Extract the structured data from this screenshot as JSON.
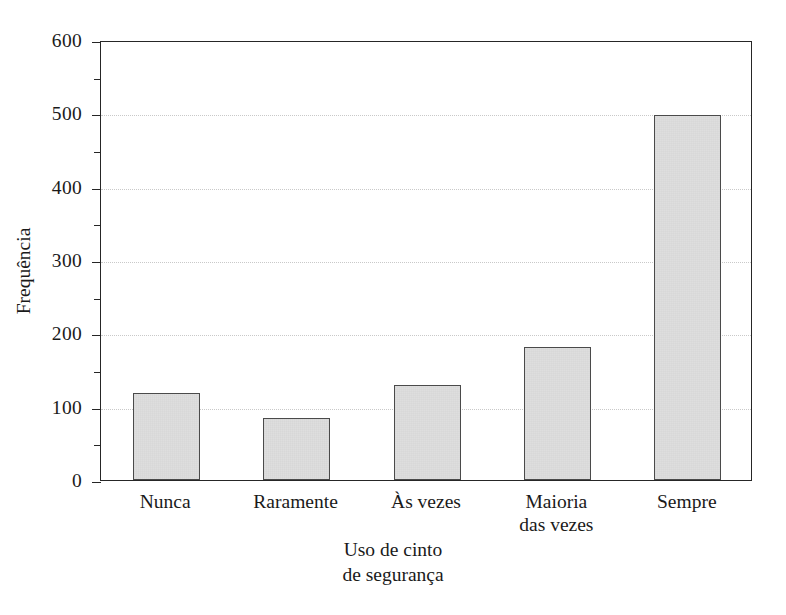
{
  "chart_data": {
    "type": "bar",
    "title": "",
    "categories": [
      "Nunca",
      "Raramente",
      "Às vezes",
      "Maioria\ndas vezes",
      "Sempre"
    ],
    "values": [
      118,
      85,
      130,
      182,
      498
    ],
    "xlabel": "Uso de cinto\nde segurança",
    "ylabel": "Frequência",
    "ylim": [
      0,
      600
    ],
    "ytick_labels": [
      "0",
      "100",
      "200",
      "300",
      "400",
      "500",
      "600"
    ],
    "ytick_values": [
      0,
      100,
      200,
      300,
      400,
      500,
      600
    ],
    "yminor_tick_values": [
      50,
      150,
      250,
      350,
      450,
      550
    ],
    "grid": "horizontal-dotted-at-major-ticks",
    "legend": "none",
    "orientation": "vertical",
    "bar_fill_color": "#cdcdcd",
    "bar_border_color": "#4a4a4a",
    "axis_color": "#262626",
    "grid_color": "#c9c9c9",
    "background_color": "#ffffff"
  }
}
